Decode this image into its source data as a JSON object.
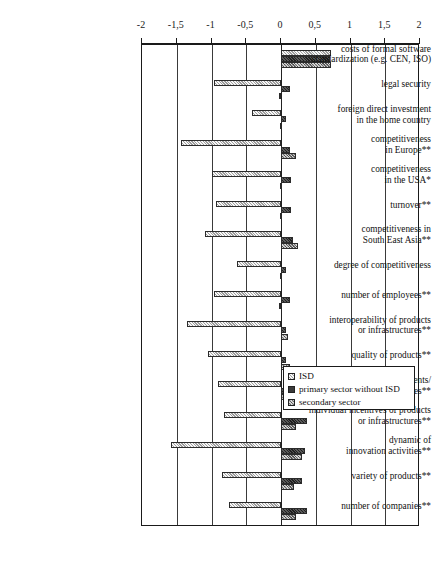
{
  "chart_data": {
    "type": "bar",
    "orientation": "horizontal",
    "title": "",
    "xlabel": "",
    "ylabel": "",
    "xlim": [
      -2,
      2
    ],
    "xticks": [
      -2,
      -1.5,
      -1,
      -0.5,
      0,
      0.5,
      1,
      1.5,
      2
    ],
    "xtick_labels": [
      "-2",
      "-1,5",
      "-1",
      "-0,5",
      "0",
      "0,5",
      "1",
      "1,5",
      "2"
    ],
    "grid": true,
    "legend_position": "center-right",
    "legend": [
      "ISD",
      "primary sector without ISD",
      "secondary sector"
    ],
    "categories": [
      "costs of formal software standardization (e.g. CEN, ISO)",
      "legal security",
      "foreign direct investment in the home country",
      "competitiveness in Europe**",
      "competitiveness in the USA*",
      "turnover**",
      "competitiveness in South East Asia**",
      "degree of competitiveness",
      "number of employees**",
      "interoperability of products or infrastructures**",
      "quality of products**",
      "variety of components/ reusables**",
      "individual incentives of products or infrastructures**",
      "dynamic of innovation activities**",
      "variety of products**",
      "number of companies**"
    ],
    "category_lines": [
      [
        "costs of formal software",
        "standardization (e.g. CEN, ISO)"
      ],
      [
        "legal security"
      ],
      [
        "foreign direct investment",
        "in the home country"
      ],
      [
        "competitiveness",
        "in Europe**"
      ],
      [
        "competitiveness",
        "in the USA*"
      ],
      [
        "turnover**"
      ],
      [
        "competitiveness in",
        "South East Asia**"
      ],
      [
        "degree of competitiveness"
      ],
      [
        "number of employees**"
      ],
      [
        "interoperability of products",
        "or infrastructures**"
      ],
      [
        "quality of products**"
      ],
      [
        "variety of components/",
        "reusables**"
      ],
      [
        "individual incentives of products",
        "or infrastructures**"
      ],
      [
        "dynamic of",
        "innovation activities**"
      ],
      [
        "variety of products**"
      ],
      [
        "number of companies**"
      ]
    ],
    "series": [
      {
        "name": "ISD",
        "style": "light-diagonal-hatch",
        "color": "#c9c9c9",
        "values": [
          0.72,
          -0.96,
          -0.42,
          -1.44,
          -1.0,
          -0.93,
          -1.1,
          -0.63,
          -0.97,
          -1.35,
          -1.05,
          -0.9,
          -0.82,
          -1.58,
          -0.85,
          -0.75
        ]
      },
      {
        "name": "primary sector without ISD",
        "style": "dark-solid",
        "color": "#3a3a3a",
        "values": [
          0.7,
          0.13,
          0.07,
          0.13,
          0.15,
          0.15,
          0.17,
          0.07,
          0.13,
          0.07,
          0.07,
          0.3,
          0.38,
          0.35,
          0.3,
          0.38
        ]
      },
      {
        "name": "secondary sector",
        "style": "medium-cross-hatch",
        "color": "#8d8d8d",
        "values": [
          0.72,
          -0.03,
          -0.02,
          0.22,
          -0.02,
          -0.02,
          0.25,
          -0.02,
          -0.03,
          0.1,
          0.13,
          0.19,
          0.22,
          0.3,
          0.19,
          0.22
        ]
      }
    ]
  },
  "legend": {
    "items": [
      {
        "label": "ISD",
        "swatch": "isd"
      },
      {
        "label": "primary sector without ISD",
        "swatch": "primary"
      },
      {
        "label": "secondary sector",
        "swatch": "secondary"
      }
    ]
  }
}
